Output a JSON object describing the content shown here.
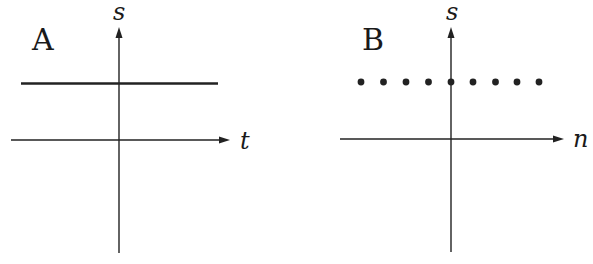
{
  "panels": [
    {
      "id": "A",
      "label": "A",
      "vertical_axis_label": "s",
      "horizontal_axis_label": "t",
      "signal_type": "continuous-constant",
      "description": "Horizontal solid line at constant s above t-axis"
    },
    {
      "id": "B",
      "label": "B",
      "vertical_axis_label": "s",
      "horizontal_axis_label": "n",
      "signal_type": "discrete-constant",
      "dot_count": 9,
      "description": "Nine equally spaced dots at constant s above n-axis"
    }
  ],
  "colors": {
    "ink": "#222222",
    "background": "#ffffff"
  }
}
